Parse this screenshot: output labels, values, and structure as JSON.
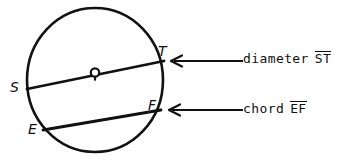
{
  "figure": {
    "kind": "geometry-diagram",
    "background_color": "#ffffff",
    "ink_color": "#111111",
    "circle": {
      "center_label": "O",
      "center_x": 95,
      "center_y": 80,
      "radius_x": 68,
      "radius_y": 72
    },
    "point_labels": [
      {
        "name": "S",
        "text": "S",
        "x": 10,
        "y": 86
      },
      {
        "name": "T",
        "text": "T",
        "x": 160,
        "y": 48
      },
      {
        "name": "E",
        "text": "E",
        "x": 31,
        "y": 123
      },
      {
        "name": "F",
        "text": "F",
        "x": 150,
        "y": 104
      },
      {
        "name": "O",
        "text": "O",
        "x": 88,
        "y": 60
      }
    ],
    "segments": [
      {
        "name": "diameter-ST",
        "from": "S",
        "to": "T",
        "x1": 27,
        "y1": 89,
        "x2": 164,
        "y2": 61
      },
      {
        "name": "chord-EF",
        "from": "E",
        "to": "F",
        "x1": 43,
        "y1": 130,
        "x2": 161,
        "y2": 110
      }
    ]
  },
  "annotations": [
    {
      "id": "diameter",
      "lead_word": "diameter",
      "segment_letters": "ST",
      "arrow": {
        "x_tail": 243,
        "x_head": 172,
        "y": 61
      }
    },
    {
      "id": "chord",
      "lead_word": "chord",
      "segment_letters": "EF",
      "arrow": {
        "x_tail": 243,
        "x_head": 170,
        "y": 110
      }
    }
  ]
}
